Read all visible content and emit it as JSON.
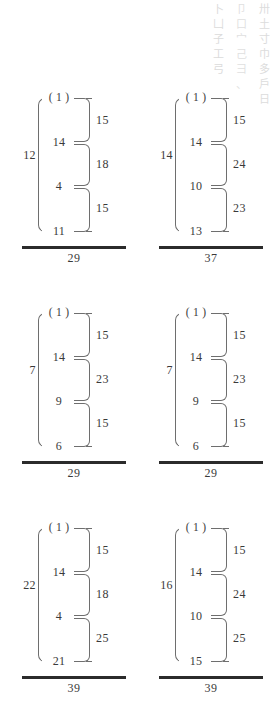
{
  "page": {
    "background": "#ffffff",
    "ink_color": "#3a3a3a",
    "rule_color": "#2b2b2b",
    "bracket_color": "#6e6e6e"
  },
  "bleed_through": {
    "description": "faded show-through characters at top right",
    "columns": [
      {
        "glyphs": [
          "卅",
          "土",
          "寸",
          "巾",
          "多",
          "戶",
          "日"
        ]
      },
      {
        "glyphs": [
          "卩",
          "口",
          "宀",
          "己",
          "彐",
          "、"
        ]
      },
      {
        "glyphs": [
          "卜",
          "凵",
          "子",
          "工",
          "弓"
        ]
      }
    ]
  },
  "problems": [
    {
      "id": "problem-1",
      "group_label": "( 1 )",
      "outer_total": "12",
      "stack": [
        "14",
        "4",
        "11"
      ],
      "addends": [
        "15",
        "18",
        "15"
      ],
      "grand_total": "29"
    },
    {
      "id": "problem-2",
      "group_label": "( 1 )",
      "outer_total": "14",
      "stack": [
        "14",
        "10",
        "13"
      ],
      "addends": [
        "15",
        "24",
        "23"
      ],
      "grand_total": "37"
    },
    {
      "id": "problem-3",
      "group_label": "( 1 )",
      "outer_total": "7",
      "stack": [
        "14",
        "9",
        "6"
      ],
      "addends": [
        "15",
        "23",
        "15"
      ],
      "grand_total": "29"
    },
    {
      "id": "problem-4",
      "group_label": "( 1 )",
      "outer_total": "7",
      "stack": [
        "14",
        "9",
        "6"
      ],
      "addends": [
        "15",
        "23",
        "15"
      ],
      "grand_total": "29"
    },
    {
      "id": "problem-5",
      "group_label": "( 1 )",
      "outer_total": "22",
      "stack": [
        "14",
        "4",
        "21"
      ],
      "addends": [
        "15",
        "18",
        "25"
      ],
      "grand_total": "39"
    },
    {
      "id": "problem-6",
      "group_label": "( 1 )",
      "outer_total": "16",
      "stack": [
        "14",
        "10",
        "15"
      ],
      "addends": [
        "15",
        "24",
        "25"
      ],
      "grand_total": "39"
    }
  ]
}
